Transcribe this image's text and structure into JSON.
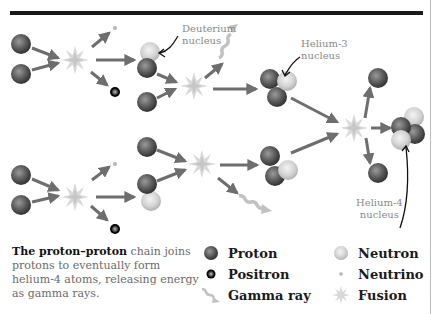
{
  "labels": {
    "deuterium": [
      "Deuterium",
      "nucleus"
    ],
    "helium3": [
      "Helium-3",
      "nucleus"
    ],
    "helium4": [
      "Helium-4",
      "nucleus"
    ]
  },
  "caption": {
    "bold": "The proton–proton",
    "rest": " chain joins protons to eventually form helium-4 atoms, releasing energy as gamma rays."
  },
  "legend": [
    {
      "key": "proton",
      "label": "Proton",
      "icon": "proton-sphere-icon"
    },
    {
      "key": "neutron",
      "label": "Neutron",
      "icon": "neutron-sphere-icon"
    },
    {
      "key": "positron",
      "label": "Positron",
      "icon": "positron-ring-icon"
    },
    {
      "key": "neutrino",
      "label": "Neutrino",
      "icon": "neutrino-dot-icon"
    },
    {
      "key": "gamma",
      "label": "Gamma ray",
      "icon": "gamma-ray-wave-icon"
    },
    {
      "key": "fusion",
      "label": "Fusion",
      "icon": "fusion-starburst-icon"
    }
  ],
  "colors": {
    "proton": "#5a5a5a",
    "neutron": "#d4d4d4",
    "positron": "#111111",
    "neutrino": "#c0c0c0",
    "gamma": "#bfbfbf",
    "fusion": "#d8d8d8",
    "arrow": "#6e6e6e",
    "label_text": "#8a8a8a",
    "rule": "#1a1a1a"
  }
}
